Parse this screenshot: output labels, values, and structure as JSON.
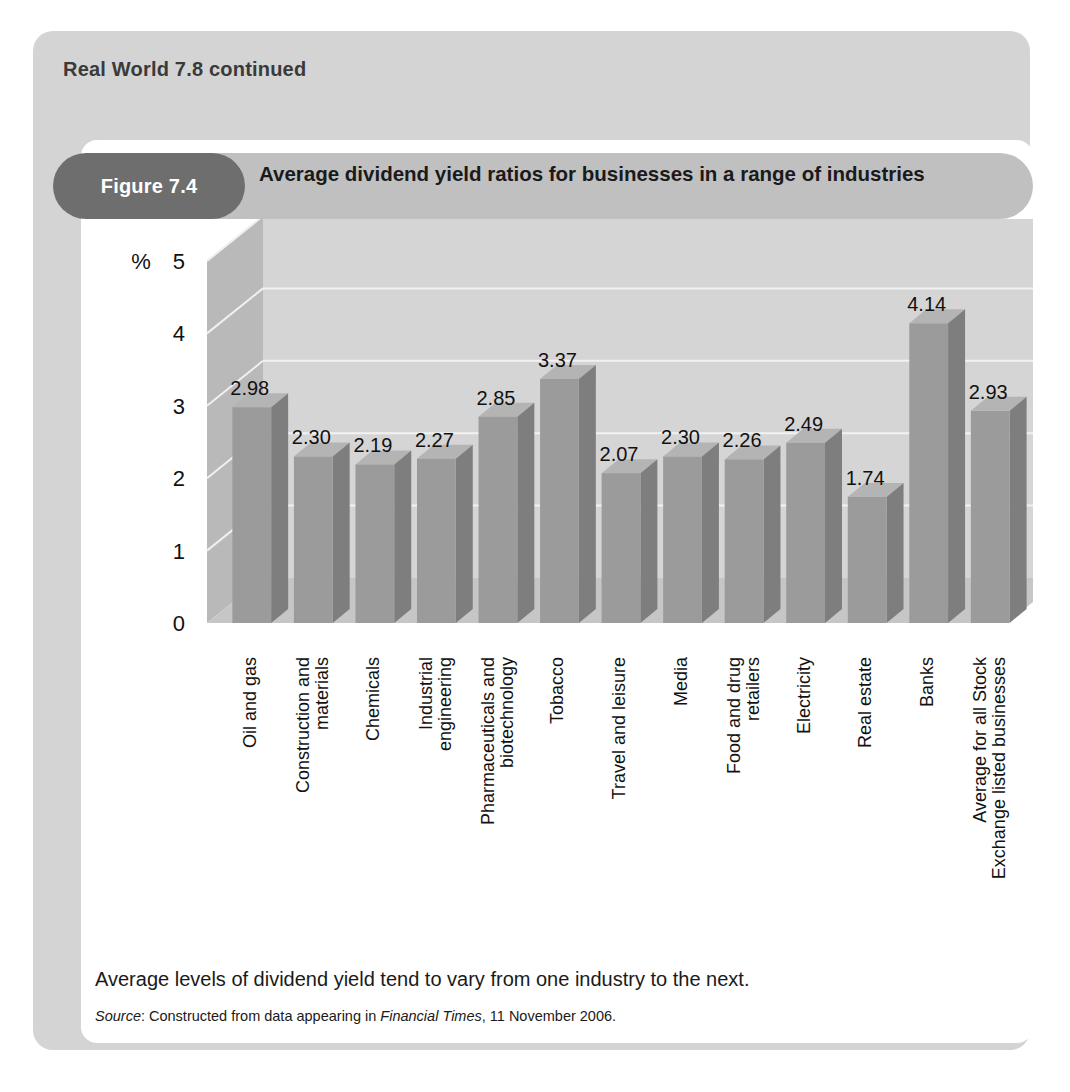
{
  "box": {
    "heading": "Real World 7.8 continued"
  },
  "figure": {
    "pill_label": "Figure 7.4",
    "title": "Average dividend yield ratios for businesses in a range of industries",
    "caption": "Average levels of dividend yield tend to vary from one industry to the next.",
    "source": {
      "prefix": "Source",
      "mid": ": Constructed from data appearing in ",
      "publication": "Financial Times",
      "suffix": ", 11 November 2006."
    }
  },
  "colors": {
    "page_background": "#ffffff",
    "outer_card": "#d4d4d4",
    "figure_card": "#ffffff",
    "header_bar": "#c0c0c0",
    "header_pill": "#6e6e6e",
    "header_pill_text": "#ffffff",
    "bar_front": "#9b9b9b",
    "bar_side": "#7e7e7e",
    "bar_top": "#b4b4b4",
    "wall_back": "#d5d5d5",
    "wall_left": "#b9b9b9",
    "floor": "#c6c6c6",
    "gridline": "#f2f2f2",
    "text": "#111111"
  },
  "chart_data": {
    "type": "bar",
    "title": "Average dividend yield ratios for businesses in a range of industries",
    "xlabel": "",
    "ylabel": "%",
    "ylim": [
      0,
      5
    ],
    "yticks": [
      0,
      1,
      2,
      3,
      4,
      5
    ],
    "ytick_labels": [
      "0",
      "1",
      "2",
      "3",
      "4",
      "5"
    ],
    "grid": true,
    "legend": false,
    "three_d": true,
    "value_labels": true,
    "categories": [
      "Oil and gas",
      "Construction and materials",
      "Chemicals",
      "Industrial engineering",
      "Pharmaceuticals and biotechnology",
      "Tobacco",
      "Travel and leisure",
      "Media",
      "Food and drug retailers",
      "Electricity",
      "Real estate",
      "Banks",
      "Average for all Stock Exchange listed businesses"
    ],
    "category_lines": [
      [
        "Oil and gas"
      ],
      [
        "Construction and",
        "materials"
      ],
      [
        "Chemicals"
      ],
      [
        "Industrial",
        "engineering"
      ],
      [
        "Pharmaceuticals and",
        "biotechnology"
      ],
      [
        "Tobacco"
      ],
      [
        "Travel and leisure"
      ],
      [
        "Media"
      ],
      [
        "Food and drug",
        "retailers"
      ],
      [
        "Electricity"
      ],
      [
        "Real estate"
      ],
      [
        "Banks"
      ],
      [
        "Average for all Stock",
        "Exchange listed businesses"
      ]
    ],
    "values": [
      2.98,
      2.3,
      2.19,
      2.27,
      2.85,
      3.37,
      2.07,
      2.3,
      2.26,
      2.49,
      1.74,
      4.14,
      2.93
    ],
    "value_label_text": [
      "2.98",
      "2.30",
      "2.19",
      "2.27",
      "2.85",
      "3.37",
      "2.07",
      "2.30",
      "2.26",
      "2.49",
      "1.74",
      "4.14",
      "2.93"
    ]
  }
}
